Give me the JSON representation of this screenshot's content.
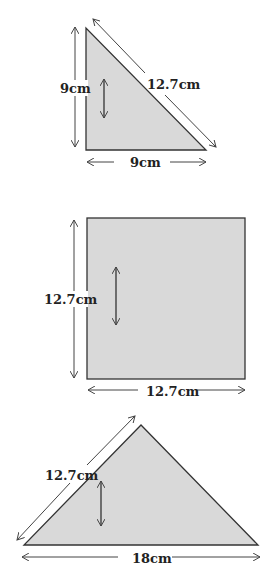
{
  "figures": [
    {
      "name": "right-triangle",
      "labels": {
        "height": "9cm",
        "hypotenuse": "12.7cm",
        "base": "9cm"
      }
    },
    {
      "name": "square",
      "labels": {
        "height": "12.7cm",
        "base": "12.7cm"
      }
    },
    {
      "name": "isosceles-triangle",
      "labels": {
        "side": "12.7cm",
        "base": "18cm"
      }
    }
  ],
  "colors": {
    "fill": "#d9d9d9",
    "stroke": "#333333"
  }
}
